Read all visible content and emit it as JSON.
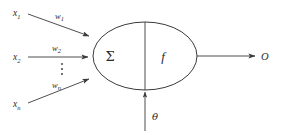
{
  "figure": {
    "background_color": "#ffffff",
    "stroke_color": "#3a3a3a",
    "text_color": "#2b2b2b"
  },
  "inputs": [
    {
      "name": "input-1",
      "label": "x",
      "subscript": "1",
      "weight_label": "w",
      "weight_subscript": "1"
    },
    {
      "name": "input-2",
      "label": "x",
      "subscript": "2",
      "weight_label": "w",
      "weight_subscript": "2"
    },
    {
      "name": "input-n",
      "label": "x",
      "subscript": "n",
      "weight_label": "w",
      "weight_subscript": "n"
    }
  ],
  "ellipsis": {
    "glyph": "⋮",
    "name": "vertical-ellipsis"
  },
  "body": {
    "sum_label": "Σ",
    "activation_label": "f",
    "divider": "vertical-divider"
  },
  "bias": {
    "label": "θ",
    "name": "threshold"
  },
  "output": {
    "label": "O",
    "name": "output"
  }
}
